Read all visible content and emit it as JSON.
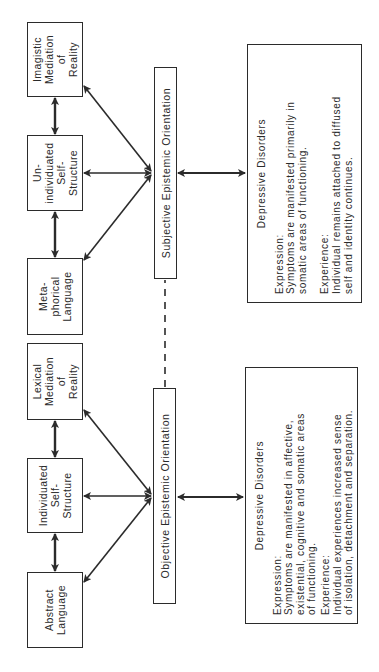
{
  "diagram": {
    "orientation": "rotated 90 degrees counter-clockwise",
    "objective_side": {
      "concepts": [
        {
          "id": "abstract",
          "label": "Abstract\nLanguage"
        },
        {
          "id": "individuated",
          "label": "Individuated\nSelf-\nStructure"
        },
        {
          "id": "lexical",
          "label": "Lexical\nMediation\nof\nReality"
        }
      ],
      "orientation_label": "Objective Epistemic Orientation",
      "disorder_box": {
        "title": "Depressive Disorders",
        "expression_label": "Expression:",
        "expression_lines": [
          "Symptoms are manifested in affective,",
          "existential, cognitive and somatic areas",
          "of functioning."
        ],
        "experience_label": "Experience:",
        "experience_lines": [
          "Individual experiences increased sense",
          "of isolation, detachment and separation."
        ]
      }
    },
    "subjective_side": {
      "concepts": [
        {
          "id": "metaphorical",
          "label": "Meta-\nphorical\nLanguage"
        },
        {
          "id": "unindividuated",
          "label": "Un-\nindividuated\nSelf-\nStructure"
        },
        {
          "id": "imagistic",
          "label": "Imagistic\nMediation\nof\nReality"
        }
      ],
      "orientation_label": "Subjective Epistemic Orientation",
      "disorder_box": {
        "title": "Depressive Disorders",
        "expression_label": "Expression:",
        "expression_lines": [
          "Symptoms are manifested primarily in",
          "somatic areas of functioning."
        ],
        "experience_label": "Experience:",
        "experience_lines": [
          "Individual remains attached to diffused",
          "self and identity continues."
        ]
      }
    },
    "connector": {
      "style": "dashed",
      "between": [
        "Objective Epistemic Orientation",
        "Subjective Epistemic Orientation"
      ]
    },
    "colors": {
      "ink": "#2b2b2b",
      "background": "#ffffff"
    }
  }
}
